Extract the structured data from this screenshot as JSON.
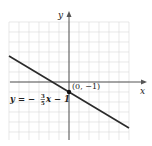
{
  "chart_data": {
    "type": "line",
    "title": "",
    "xlabel": "x",
    "ylabel": "y",
    "xlim": [
      -6,
      6
    ],
    "ylim": [
      -6,
      6
    ],
    "grid": true,
    "series": [
      {
        "name": "y = -3/5 x - 1",
        "slope": -0.6,
        "intercept": -1,
        "x": [
          -6,
          6
        ],
        "y": [
          2.6,
          -4.6
        ]
      }
    ],
    "points": [
      {
        "x": 0,
        "y": -1,
        "label": "(0, −1)"
      }
    ],
    "annotations": [
      {
        "text": "y = −3/5 x − 1",
        "position": "left, below x-axis"
      }
    ]
  },
  "labels": {
    "x_axis": "x",
    "y_axis": "y",
    "point": "(0, −1)",
    "eq_lhs": "y = −",
    "eq_num": "3",
    "eq_den": "5",
    "eq_rhs": "x − 1"
  },
  "colors": {
    "grid": "#d9d9d9",
    "axis": "#555555",
    "line": "#2a2a2a",
    "point": "#111111"
  }
}
